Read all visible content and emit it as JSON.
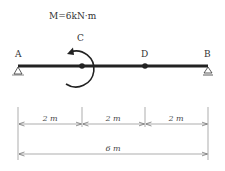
{
  "diagram": {
    "moment_label": "M=6kN·m",
    "points": [
      {
        "id": "A",
        "label": "A",
        "position_m": 0,
        "type": "pin-support"
      },
      {
        "id": "C",
        "label": "C",
        "position_m": 2,
        "type": "hinge"
      },
      {
        "id": "D",
        "label": "D",
        "position_m": 4,
        "type": "hinge"
      },
      {
        "id": "B",
        "label": "B",
        "position_m": 6,
        "type": "roller-support"
      }
    ],
    "moment": {
      "at": "C",
      "value": "6",
      "unit": "kN·m",
      "direction": "counterclockwise"
    },
    "dimensions": {
      "segments": [
        "2 m",
        "2 m",
        "2 m"
      ],
      "total": "6 m"
    },
    "total_length_m": 6
  }
}
